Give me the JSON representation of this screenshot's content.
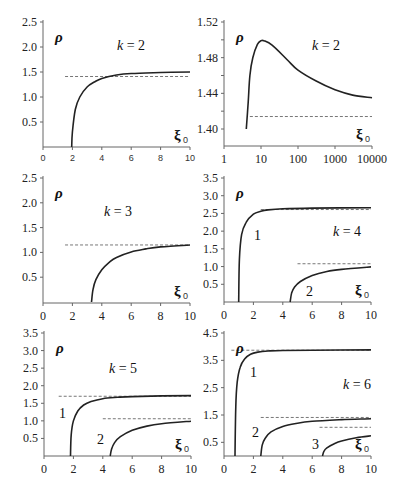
{
  "chart_data": [
    {
      "id": "A",
      "type": "line",
      "annotation": "k = 2",
      "ylabel": "ρ",
      "xlabel": "ξ0",
      "xlim": [
        0,
        10
      ],
      "ylim": [
        0,
        2.5
      ],
      "xticks": [
        "0",
        "2",
        "4",
        "6",
        "8",
        "10"
      ],
      "yticks": [
        "0.5",
        "1.0",
        "1.5",
        "2.0",
        "2.5"
      ],
      "series": [
        {
          "name": "curve",
          "x": [
            1.95,
            2.0,
            2.2,
            2.5,
            3,
            3.5,
            4,
            5,
            6,
            8,
            10
          ],
          "y": [
            0,
            0.3,
            0.75,
            1.0,
            1.2,
            1.3,
            1.37,
            1.44,
            1.47,
            1.49,
            1.5
          ]
        }
      ],
      "asymptotes": [
        {
          "y": 1.41,
          "x_from": 1.5,
          "x_to": 10
        }
      ]
    },
    {
      "id": "B",
      "type": "line",
      "annotation": "k = 2",
      "ylabel": "ρ",
      "xlabel": "ξ0",
      "xscale": "log",
      "xlim": [
        1,
        10000
      ],
      "ylim": [
        1.39,
        1.52
      ],
      "xticks": [
        "1",
        "10",
        "100",
        "1000",
        "10000"
      ],
      "yticks": [
        "1.40",
        "1.44",
        "1.48",
        "1.52"
      ],
      "series": [
        {
          "name": "curve",
          "x": [
            4,
            4.5,
            5,
            6,
            8,
            10,
            12,
            20,
            50,
            100,
            300,
            1000,
            3000,
            10000
          ],
          "y": [
            1.39,
            1.43,
            1.46,
            1.48,
            1.495,
            1.499,
            1.499,
            1.494,
            1.478,
            1.466,
            1.454,
            1.444,
            1.438,
            1.435
          ]
        }
      ],
      "asymptotes": [
        {
          "y": 1.414,
          "x_from": 5,
          "x_to": 10000
        }
      ]
    },
    {
      "id": "C",
      "type": "line",
      "annotation": "k = 3",
      "ylabel": "ρ",
      "xlabel": "ξ0",
      "xlim": [
        0,
        10
      ],
      "ylim": [
        0,
        2.5
      ],
      "xticks": [
        "0",
        "2",
        "4",
        "6",
        "8",
        "10"
      ],
      "yticks": [
        "0.5",
        "1.0",
        "1.5",
        "2.0",
        "2.5"
      ],
      "series": [
        {
          "name": "curve",
          "x": [
            3.3,
            3.4,
            3.6,
            4,
            4.5,
            5,
            6,
            7,
            8,
            10
          ],
          "y": [
            0,
            0.25,
            0.45,
            0.65,
            0.8,
            0.9,
            1.01,
            1.07,
            1.11,
            1.15
          ]
        }
      ],
      "asymptotes": [
        {
          "y": 1.15,
          "x_from": 1.5,
          "x_to": 10
        }
      ]
    },
    {
      "id": "D",
      "type": "line",
      "annotation": "k = 4",
      "ylabel": "ρ",
      "xlabel": "ξ0",
      "xlim": [
        0,
        10
      ],
      "ylim": [
        0,
        3.5
      ],
      "xticks": [
        "0",
        "2",
        "4",
        "6",
        "8",
        "10"
      ],
      "yticks": [
        "0.5",
        "1.0",
        "1.5",
        "2.0",
        "2.5",
        "3.0",
        "3.5"
      ],
      "series": [
        {
          "name": "1",
          "x": [
            1.0,
            1.05,
            1.2,
            1.5,
            2,
            2.5,
            3,
            4,
            6,
            10
          ],
          "y": [
            0,
            1.2,
            1.9,
            2.25,
            2.48,
            2.56,
            2.6,
            2.63,
            2.65,
            2.66
          ]
        },
        {
          "name": "2",
          "x": [
            4.5,
            4.6,
            4.8,
            5.2,
            6,
            7,
            8,
            10
          ],
          "y": [
            0,
            0.25,
            0.42,
            0.58,
            0.75,
            0.86,
            0.92,
            0.99
          ]
        }
      ],
      "asymptotes": [
        {
          "y": 2.61,
          "x_from": 2.5,
          "x_to": 10
        },
        {
          "y": 1.08,
          "x_from": 5,
          "x_to": 10
        }
      ]
    },
    {
      "id": "E",
      "type": "line",
      "annotation": "k = 5",
      "ylabel": "ρ",
      "xlabel": "ξ0",
      "xlim": [
        0,
        10
      ],
      "ylim": [
        0,
        3.5
      ],
      "xticks": [
        "0",
        "2",
        "4",
        "6",
        "8",
        "10"
      ],
      "yticks": [
        "0.5",
        "1.0",
        "1.5",
        "2.0",
        "2.5",
        "3.0",
        "3.5"
      ],
      "series": [
        {
          "name": "1",
          "x": [
            1.8,
            1.85,
            2.0,
            2.3,
            2.7,
            3.2,
            4,
            5,
            6,
            8,
            10
          ],
          "y": [
            0,
            0.6,
            1.0,
            1.28,
            1.45,
            1.55,
            1.63,
            1.67,
            1.69,
            1.71,
            1.72
          ]
        },
        {
          "name": "2",
          "x": [
            4.5,
            4.6,
            4.8,
            5.2,
            6,
            7,
            8,
            10
          ],
          "y": [
            0,
            0.2,
            0.38,
            0.55,
            0.73,
            0.85,
            0.92,
            0.99
          ]
        }
      ],
      "asymptotes": [
        {
          "y": 1.7,
          "x_from": 1,
          "x_to": 10
        },
        {
          "y": 1.06,
          "x_from": 4,
          "x_to": 10
        }
      ]
    },
    {
      "id": "F",
      "type": "line",
      "annotation": "k = 6",
      "ylabel": "ρ",
      "xlabel": "ξ0",
      "xlim": [
        0,
        10
      ],
      "ylim": [
        0,
        4.5
      ],
      "xticks": [
        "0",
        "2",
        "4",
        "6",
        "8",
        "10"
      ],
      "yticks": [
        "0.5",
        "1.5",
        "2.5",
        "3.5",
        "4.5"
      ],
      "series": [
        {
          "name": "1",
          "x": [
            0.75,
            0.8,
            0.9,
            1.1,
            1.4,
            1.8,
            2.3,
            3,
            4,
            6,
            10
          ],
          "y": [
            0,
            1.8,
            2.7,
            3.25,
            3.55,
            3.72,
            3.8,
            3.84,
            3.86,
            3.87,
            3.88
          ]
        },
        {
          "name": "2",
          "x": [
            2.5,
            2.6,
            2.8,
            3.2,
            4,
            5,
            6,
            8,
            10
          ],
          "y": [
            0,
            0.4,
            0.65,
            0.88,
            1.08,
            1.2,
            1.27,
            1.33,
            1.36
          ]
        },
        {
          "name": "3",
          "x": [
            6.7,
            6.8,
            7.0,
            7.5,
            8,
            9,
            10
          ],
          "y": [
            0,
            0.18,
            0.3,
            0.45,
            0.55,
            0.67,
            0.74
          ]
        }
      ],
      "asymptotes": [
        {
          "y": 3.87,
          "x_from": 0.5,
          "x_to": 10
        },
        {
          "y": 1.41,
          "x_from": 2.5,
          "x_to": 10
        },
        {
          "y": 1.05,
          "x_from": 6.5,
          "x_to": 10
        }
      ]
    }
  ],
  "labels": {
    "rho": "ρ",
    "xi": "ξ",
    "xi_sub": "0",
    "k2": "k = 2",
    "k3": "k = 3",
    "k4": "k = 4",
    "k5": "k = 5",
    "k6": "k = 6",
    "c1": "1",
    "c2": "2",
    "c3": "3"
  },
  "ticks": {
    "lin10": [
      "0",
      "2",
      "4",
      "6",
      "8",
      "10"
    ],
    "log": [
      "1",
      "10",
      "100",
      "1000",
      "10000"
    ],
    "yA": [
      "0.5",
      "1.0",
      "1.5",
      "2.0",
      "2.5"
    ],
    "yB": [
      "1.40",
      "1.44",
      "1.48",
      "1.52"
    ],
    "yD": [
      "0.5",
      "1.0",
      "1.5",
      "2.0",
      "2.5",
      "3.0",
      "3.5"
    ],
    "yF": [
      "0.5",
      "1.5",
      "2.5",
      "3.5",
      "4.5"
    ]
  }
}
